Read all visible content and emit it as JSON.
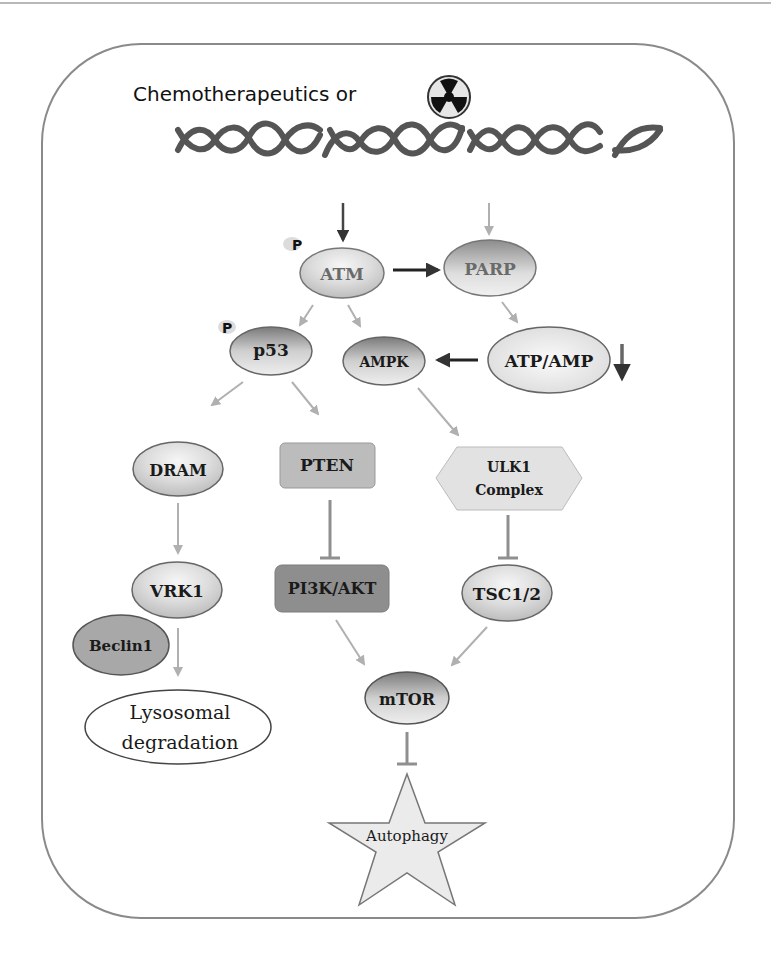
{
  "header": {
    "title": "Chemotherapeutics or",
    "radiation_icon": "radiation-icon",
    "dna_icon": "dna-helix-icon"
  },
  "nodes": {
    "atm": {
      "label": "ATM",
      "phospho": "P"
    },
    "parp": {
      "label": "PARP"
    },
    "p53": {
      "label": "p53",
      "phospho": "P"
    },
    "ampk": {
      "label": "AMPK"
    },
    "atp_amp": {
      "label": "ATP/AMP"
    },
    "dram": {
      "label": "DRAM"
    },
    "pten": {
      "label": "PTEN"
    },
    "ulk1": {
      "label_line1": "ULK1",
      "label_line2": "Complex"
    },
    "vrk1": {
      "label": "VRK1"
    },
    "pi3k_akt": {
      "label": "PI3K/AKT"
    },
    "tsc": {
      "label": "TSC1/2"
    },
    "beclin1": {
      "label": "Beclin1"
    },
    "mtor": {
      "label": "mTOR"
    },
    "lysosomal": {
      "label_line1": "Lysosomal",
      "label_line2": "degradation"
    },
    "autophagy": {
      "label": "Autophagy"
    }
  },
  "edges": [
    {
      "from": "DNA damage",
      "to": "ATM",
      "type": "activation"
    },
    {
      "from": "DNA damage",
      "to": "PARP",
      "type": "activation"
    },
    {
      "from": "ATM",
      "to": "PARP",
      "type": "activation"
    },
    {
      "from": "ATM",
      "to": "p53",
      "type": "activation"
    },
    {
      "from": "ATM",
      "to": "AMPK",
      "type": "activation"
    },
    {
      "from": "PARP",
      "to": "ATP/AMP",
      "type": "activation"
    },
    {
      "from": "ATP/AMP",
      "to": "AMPK",
      "type": "activation"
    },
    {
      "from": "p53",
      "to": "DRAM",
      "type": "activation"
    },
    {
      "from": "p53",
      "to": "PTEN",
      "type": "activation"
    },
    {
      "from": "AMPK",
      "to": "ULK1 Complex",
      "type": "activation"
    },
    {
      "from": "DRAM",
      "to": "VRK1",
      "type": "activation"
    },
    {
      "from": "PTEN",
      "to": "PI3K/AKT",
      "type": "inhibition"
    },
    {
      "from": "ULK1 Complex",
      "to": "TSC1/2",
      "type": "inhibition"
    },
    {
      "from": "VRK1",
      "to": "Lysosomal degradation",
      "type": "activation"
    },
    {
      "from": "PI3K/AKT",
      "to": "mTOR",
      "type": "activation"
    },
    {
      "from": "TSC1/2",
      "to": "mTOR",
      "type": "activation"
    },
    {
      "from": "mTOR",
      "to": "Autophagy",
      "type": "inhibition"
    }
  ],
  "colors": {
    "frame": "#8a8a8a",
    "arrow_dark": "#333333",
    "arrow_light": "#b0b0b0",
    "inhibit": "#8f8f8f",
    "box_gray": "#b9b9b9",
    "box_dark": "#8e8e8e"
  }
}
